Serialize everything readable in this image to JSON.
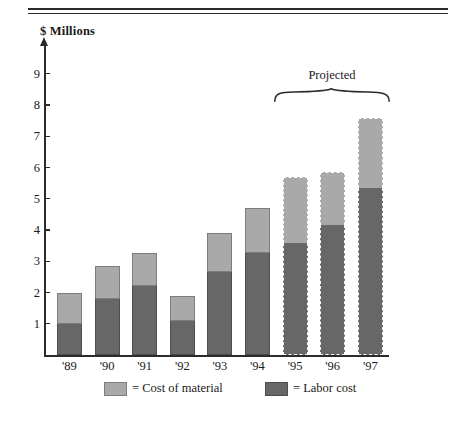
{
  "figure": {
    "axis_title": "$ Millions",
    "bracket_label": "Projected"
  },
  "legend": {
    "items": [
      {
        "label": "= Cost of material",
        "swatch": "material-swatch",
        "color": "#a9a9a9"
      },
      {
        "label": "= Labor cost",
        "swatch": "labor-swatch",
        "color": "#676767"
      }
    ]
  },
  "chart_data": {
    "type": "bar",
    "subtype": "stacked-vertical",
    "title": "",
    "subtitle": "",
    "xlabel": "",
    "ylabel": "$ Millions",
    "ylim": [
      0,
      9.6
    ],
    "ytick_labels": [
      "1",
      "2",
      "3",
      "4",
      "5",
      "6",
      "7",
      "8",
      "9"
    ],
    "ytick_values": [
      1,
      2,
      3,
      4,
      5,
      6,
      7,
      8,
      9
    ],
    "grid": false,
    "legend_position": "bottom",
    "categories": [
      "'89",
      "'90",
      "'91",
      "'92",
      "'93",
      "'94",
      "'95",
      "'96",
      "'97"
    ],
    "series": [
      {
        "name": "Labor cost",
        "color": "#676767",
        "values": [
          1.0,
          1.8,
          2.2,
          1.1,
          2.65,
          3.25,
          3.6,
          4.15,
          5.35
        ]
      },
      {
        "name": "Cost of material",
        "color": "#a9a9a9",
        "values": [
          1.0,
          1.05,
          1.05,
          0.8,
          1.25,
          1.45,
          2.1,
          1.7,
          2.25
        ]
      }
    ],
    "totals": [
      2.0,
      2.85,
      3.25,
      1.9,
      3.9,
      4.7,
      5.7,
      5.85,
      7.6
    ],
    "annotations": [
      {
        "text": "Projected",
        "covers": [
          "'95",
          "'96",
          "'97"
        ],
        "style": "curly-brace-above"
      }
    ],
    "projected_categories": [
      "'95",
      "'96",
      "'97"
    ]
  }
}
